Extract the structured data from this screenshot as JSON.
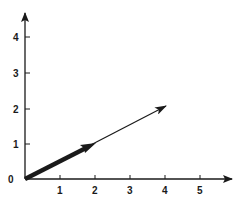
{
  "diagram": {
    "type": "vector-plot",
    "colors": {
      "ink": "#1a1a1a",
      "background": "#ffffff"
    },
    "origin_label": "0",
    "x_axis": {
      "ticks": [
        "1",
        "2",
        "3",
        "4",
        "5"
      ]
    },
    "y_axis": {
      "ticks": [
        "1",
        "2",
        "3",
        "4"
      ]
    },
    "vectors": [
      {
        "name": "short-thick-vector",
        "from": [
          0,
          0
        ],
        "to": [
          2,
          1
        ],
        "style": "thick"
      },
      {
        "name": "long-thin-vector",
        "from": [
          0,
          0
        ],
        "to": [
          4,
          2
        ],
        "style": "thin"
      }
    ]
  }
}
